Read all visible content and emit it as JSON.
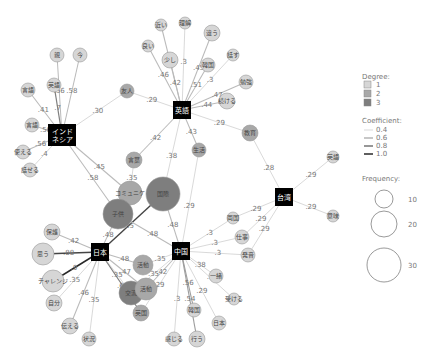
{
  "hubs": [
    {
      "id": "indonesia",
      "label": "インド\nネシア",
      "x": 62,
      "y": 135
    },
    {
      "id": "eigo",
      "label": "英語",
      "x": 182,
      "y": 110
    },
    {
      "id": "taiwan",
      "label": "台湾",
      "x": 284,
      "y": 197
    },
    {
      "id": "nihon",
      "label": "日本",
      "x": 100,
      "y": 252
    },
    {
      "id": "chugoku",
      "label": "中国",
      "x": 181,
      "y": 251
    }
  ],
  "nodes": [
    {
      "id": "n1",
      "label": "親",
      "x": 57,
      "y": 55,
      "r": 7,
      "degree": 1
    },
    {
      "id": "n2",
      "label": "今",
      "x": 80,
      "y": 55,
      "r": 7,
      "degree": 1
    },
    {
      "id": "n3",
      "label": "英語",
      "x": 54,
      "y": 85,
      "r": 7,
      "degree": 1
    },
    {
      "id": "n4",
      "label": "言語",
      "x": 28,
      "y": 90,
      "r": 7,
      "degree": 1
    },
    {
      "id": "n5",
      "label": "言語",
      "x": 32,
      "y": 125,
      "r": 7,
      "degree": 1
    },
    {
      "id": "n6",
      "label": "使える",
      "x": 23,
      "y": 152,
      "r": 7,
      "degree": 1
    },
    {
      "id": "n7",
      "label": "話せる",
      "x": 30,
      "y": 170,
      "r": 7,
      "degree": 1
    },
    {
      "id": "n8",
      "label": "友人",
      "x": 127,
      "y": 91,
      "r": 7,
      "degree": 2
    },
    {
      "id": "n9",
      "label": "近い",
      "x": 161,
      "y": 25,
      "r": 6,
      "degree": 1
    },
    {
      "id": "n10",
      "label": "理解",
      "x": 185,
      "y": 23,
      "r": 6,
      "degree": 1
    },
    {
      "id": "n11",
      "label": "違う",
      "x": 212,
      "y": 33,
      "r": 8,
      "degree": 1
    },
    {
      "id": "n12",
      "label": "良い",
      "x": 148,
      "y": 46,
      "r": 6,
      "degree": 1
    },
    {
      "id": "n13",
      "label": "少し",
      "x": 170,
      "y": 60,
      "r": 8,
      "degree": 1
    },
    {
      "id": "n14",
      "label": "韓国",
      "x": 208,
      "y": 65,
      "r": 7,
      "degree": 1
    },
    {
      "id": "n15",
      "label": "話す",
      "x": 233,
      "y": 55,
      "r": 6,
      "degree": 1
    },
    {
      "id": "n16",
      "label": "勉強",
      "x": 246,
      "y": 82,
      "r": 7,
      "degree": 1
    },
    {
      "id": "n17",
      "label": "続ける",
      "x": 227,
      "y": 101,
      "r": 8,
      "degree": 1
    },
    {
      "id": "n18",
      "label": "教育",
      "x": 250,
      "y": 133,
      "r": 8,
      "degree": 2
    },
    {
      "id": "n19",
      "label": "言葉",
      "x": 134,
      "y": 160,
      "r": 8,
      "degree": 2
    },
    {
      "id": "n20",
      "label": "生活",
      "x": 199,
      "y": 150,
      "r": 7,
      "degree": 2
    },
    {
      "id": "n21",
      "label": "コミュニケ",
      "x": 130,
      "y": 193,
      "r": 12,
      "degree": 2
    },
    {
      "id": "n22",
      "label": "国際",
      "x": 163,
      "y": 194,
      "r": 17,
      "degree": 3
    },
    {
      "id": "n23",
      "label": "子供",
      "x": 118,
      "y": 214,
      "r": 15,
      "degree": 3
    },
    {
      "id": "n24",
      "label": "英語",
      "x": 333,
      "y": 157,
      "r": 6,
      "degree": 1
    },
    {
      "id": "n25",
      "label": "意味",
      "x": 333,
      "y": 216,
      "r": 6,
      "degree": 1
    },
    {
      "id": "n26",
      "label": "両国",
      "x": 233,
      "y": 218,
      "r": 6,
      "degree": 1
    },
    {
      "id": "n27",
      "label": "仕事",
      "x": 242,
      "y": 237,
      "r": 7,
      "degree": 1
    },
    {
      "id": "n28",
      "label": "発音",
      "x": 248,
      "y": 255,
      "r": 7,
      "degree": 1
    },
    {
      "id": "n29",
      "label": "保護",
      "x": 52,
      "y": 232,
      "r": 8,
      "degree": 1
    },
    {
      "id": "n30",
      "label": "思う",
      "x": 43,
      "y": 254,
      "r": 11,
      "degree": 1
    },
    {
      "id": "n31",
      "label": "チャレンジ",
      "x": 53,
      "y": 281,
      "r": 11,
      "degree": 1
    },
    {
      "id": "n32",
      "label": "自分",
      "x": 54,
      "y": 303,
      "r": 8,
      "degree": 1
    },
    {
      "id": "n33",
      "label": "伝える",
      "x": 70,
      "y": 326,
      "r": 8,
      "degree": 1
    },
    {
      "id": "n34",
      "label": "状況",
      "x": 89,
      "y": 339,
      "r": 7,
      "degree": 1
    },
    {
      "id": "n35",
      "label": "活動",
      "x": 143,
      "y": 265,
      "r": 10,
      "degree": 2
    },
    {
      "id": "n36",
      "label": "交流",
      "x": 131,
      "y": 293,
      "r": 12,
      "degree": 3
    },
    {
      "id": "n37",
      "label": "活動",
      "x": 146,
      "y": 289,
      "r": 11,
      "degree": 2
    },
    {
      "id": "n38",
      "label": "英国",
      "x": 141,
      "y": 313,
      "r": 8,
      "degree": 2
    },
    {
      "id": "n39",
      "label": "一緒",
      "x": 216,
      "y": 276,
      "r": 7,
      "degree": 1
    },
    {
      "id": "n40",
      "label": "受ける",
      "x": 234,
      "y": 299,
      "r": 6,
      "degree": 1
    },
    {
      "id": "n41",
      "label": "韓国",
      "x": 194,
      "y": 310,
      "r": 7,
      "degree": 1
    },
    {
      "id": "n42",
      "label": "日本",
      "x": 219,
      "y": 323,
      "r": 7,
      "degree": 1
    },
    {
      "id": "n43",
      "label": "行う",
      "x": 197,
      "y": 339,
      "r": 8,
      "degree": 1
    },
    {
      "id": "n44",
      "label": "感じる",
      "x": 174,
      "y": 339,
      "r": 7,
      "degree": 1
    }
  ],
  "edges": [
    {
      "from": "indonesia",
      "to": "n1",
      "label": ".56",
      "w": 0.5
    },
    {
      "from": "indonesia",
      "to": "n2",
      "label": ".58",
      "w": 0.5
    },
    {
      "from": "indonesia",
      "to": "n3",
      "label": ".7",
      "w": 0.7
    },
    {
      "from": "indonesia",
      "to": "n4",
      "label": ".41",
      "w": 0.5
    },
    {
      "from": "indonesia",
      "to": "n5",
      "label": ".56",
      "w": 0.5
    },
    {
      "from": "indonesia",
      "to": "n6",
      "label": ".56",
      "w": 0.5
    },
    {
      "from": "indonesia",
      "to": "n7",
      "label": ".4",
      "w": 0.4
    },
    {
      "from": "indonesia",
      "to": "n8",
      "label": ".30",
      "w": 0.4
    },
    {
      "from": "indonesia",
      "to": "n21",
      "label": ".45",
      "w": 0.5
    },
    {
      "from": "indonesia",
      "to": "n23",
      "label": ".58",
      "w": 0.5
    },
    {
      "from": "eigo",
      "to": "n8",
      "label": ".29",
      "w": 0.4
    },
    {
      "from": "eigo",
      "to": "n9",
      "label": ".46",
      "w": 0.5
    },
    {
      "from": "eigo",
      "to": "n10",
      "label": ".3",
      "w": 0.4
    },
    {
      "from": "eigo",
      "to": "n11",
      "label": ".45",
      "w": 0.5
    },
    {
      "from": "eigo",
      "to": "n12",
      "label": ".46",
      "w": 0.5
    },
    {
      "from": "eigo",
      "to": "n13",
      "label": ".42",
      "w": 0.5
    },
    {
      "from": "eigo",
      "to": "n14",
      "label": ".51",
      "w": 0.5
    },
    {
      "from": "eigo",
      "to": "n15",
      "label": ".3",
      "w": 0.4
    },
    {
      "from": "eigo",
      "to": "n16",
      "label": ".47",
      "w": 0.5
    },
    {
      "from": "eigo",
      "to": "n17",
      "label": ".44",
      "w": 0.5
    },
    {
      "from": "eigo",
      "to": "n18",
      "label": ".29",
      "w": 0.4
    },
    {
      "from": "eigo",
      "to": "n19",
      "label": ".42",
      "w": 0.5
    },
    {
      "from": "eigo",
      "to": "n22",
      "label": ".38",
      "w": 0.4
    },
    {
      "from": "eigo",
      "to": "n20",
      "label": ".43",
      "w": 0.5
    },
    {
      "from": "n18",
      "to": "taiwan",
      "label": ".28",
      "w": 0.4
    },
    {
      "from": "taiwan",
      "to": "n24",
      "label": ".29",
      "w": 0.4
    },
    {
      "from": "taiwan",
      "to": "n25",
      "label": ".29",
      "w": 0.4
    },
    {
      "from": "taiwan",
      "to": "n26",
      "label": ".29",
      "w": 0.4
    },
    {
      "from": "taiwan",
      "to": "n27",
      "label": ".29",
      "w": 0.4
    },
    {
      "from": "taiwan",
      "to": "n28",
      "label": ".29",
      "w": 0.4
    },
    {
      "from": "n19",
      "to": "n21",
      "label": ".35",
      "w": 0.4
    },
    {
      "from": "n20",
      "to": "chugoku",
      "label": ".29",
      "w": 0.4
    },
    {
      "from": "n22",
      "to": "chugoku",
      "label": ".48",
      "w": 0.5
    },
    {
      "from": "n22",
      "to": "nihon",
      "label": ".35",
      "w": 0.9
    },
    {
      "from": "n23",
      "to": "nihon",
      "label": ".48",
      "w": 0.5
    },
    {
      "from": "n23",
      "to": "chugoku",
      "label": ".48",
      "w": 0.5
    },
    {
      "from": "chugoku",
      "to": "n26",
      "label": ".3",
      "w": 0.4
    },
    {
      "from": "chugoku",
      "to": "n27",
      "label": ".3",
      "w": 0.4
    },
    {
      "from": "chugoku",
      "to": "n28",
      "label": ".3",
      "w": 0.4
    },
    {
      "from": "nihon",
      "to": "n29",
      "label": ".42",
      "w": 0.5
    },
    {
      "from": "nihon",
      "to": "n30",
      "label": ".88",
      "w": 0.9
    },
    {
      "from": "nihon",
      "to": "n31",
      "label": ".9",
      "w": 1.0
    },
    {
      "from": "nihon",
      "to": "n32",
      "label": ".35",
      "w": 0.4
    },
    {
      "from": "nihon",
      "to": "n33",
      "label": ".46",
      "w": 0.5
    },
    {
      "from": "nihon",
      "to": "n34",
      "label": ".35",
      "w": 0.4
    },
    {
      "from": "nihon",
      "to": "n35",
      "label": ".48",
      "w": 0.5
    },
    {
      "from": "nihon",
      "to": "n36",
      "label": ".35",
      "w": 0.4
    },
    {
      "from": "nihon",
      "to": "n37",
      "label": ".47",
      "w": 0.5
    },
    {
      "from": "nihon",
      "to": "n38",
      "label": ".67",
      "w": 0.7
    },
    {
      "from": "chugoku",
      "to": "n35",
      "label": ".35",
      "w": 0.4
    },
    {
      "from": "chugoku",
      "to": "n36",
      "label": ".35",
      "w": 0.4
    },
    {
      "from": "chugoku",
      "to": "n37",
      "label": ".42",
      "w": 0.5
    },
    {
      "from": "chugoku",
      "to": "n38",
      "label": ".29",
      "w": 0.4
    },
    {
      "from": "chugoku",
      "to": "n39",
      "label": ".38",
      "w": 0.4
    },
    {
      "from": "chugoku",
      "to": "n40",
      "label": ".3",
      "w": 0.4
    },
    {
      "from": "chugoku",
      "to": "n41",
      "label": ".56",
      "w": 0.6
    },
    {
      "from": "chugoku",
      "to": "n42",
      "label": ".29",
      "w": 0.4
    },
    {
      "from": "chugoku",
      "to": "n43",
      "label": ".54",
      "w": 0.6
    },
    {
      "from": "chugoku",
      "to": "n44",
      "label": ".3",
      "w": 0.4
    }
  ],
  "degree_colors": {
    "1": "#d6d6d6",
    "2": "#a8a8a8",
    "3": "#7e7e7e"
  },
  "legend": {
    "degree_title": "Degree:",
    "degree_items": [
      {
        "label": "1",
        "color": "#d6d6d6"
      },
      {
        "label": "2",
        "color": "#a8a8a8"
      },
      {
        "label": "3",
        "color": "#7e7e7e"
      }
    ],
    "coef_title": "Coefficient:",
    "coef_items": [
      {
        "label": "0.4",
        "w": 0.4
      },
      {
        "label": "0.6",
        "w": 0.6
      },
      {
        "label": "0.8",
        "w": 0.8
      },
      {
        "label": "1.0",
        "w": 1.0
      }
    ],
    "freq_title": "Frequency:",
    "freq_items": [
      {
        "label": "10",
        "r": 9
      },
      {
        "label": "20",
        "r": 13
      },
      {
        "label": "30",
        "r": 17
      }
    ]
  }
}
